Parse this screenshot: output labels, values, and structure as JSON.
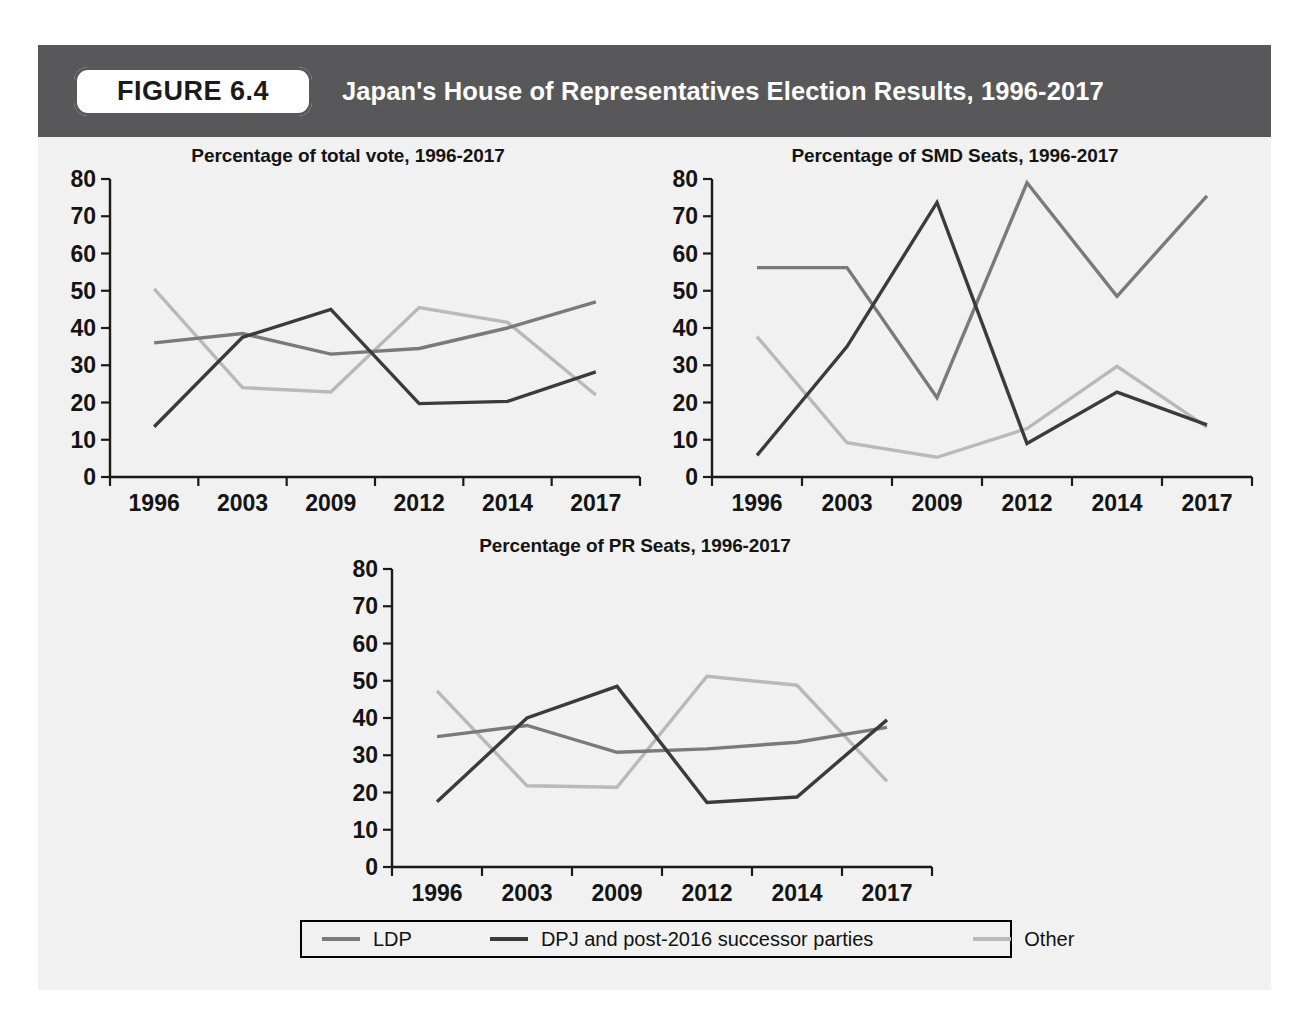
{
  "figure": {
    "badge_label": "FIGURE 6.4",
    "title": "Japan's House of Representatives Election Results, 1996-2017"
  },
  "colors": {
    "header_bar": "#58585a",
    "panel_background": "#f1f1f1",
    "page_background": "#ffffff",
    "axis": "#1a1a1a",
    "ldp": "#7a7a7a",
    "dpj": "#3b3b3b",
    "other": "#b9b9b9"
  },
  "legend": {
    "entries": [
      {
        "key": "ldp",
        "label": "LDP",
        "color": "#7a7a7a"
      },
      {
        "key": "dpj",
        "label": "DPJ and post-2016 successor parties",
        "color": "#3b3b3b"
      },
      {
        "key": "other",
        "label": "Other",
        "color": "#b9b9b9"
      }
    ]
  },
  "chart_data": [
    {
      "id": "total-vote",
      "type": "line",
      "title": "Percentage of total vote, 1996-2017",
      "xlabel": "",
      "ylabel": "",
      "categories": [
        "1996",
        "2003",
        "2009",
        "2012",
        "2014",
        "2017"
      ],
      "yticks": [
        0,
        10,
        20,
        30,
        40,
        50,
        60,
        70,
        80
      ],
      "ylim": [
        0,
        80
      ],
      "grid": false,
      "legend_position": "bottom-shared",
      "series": [
        {
          "name": "LDP",
          "color": "#7a7a7a",
          "values": [
            36.0,
            38.5,
            33.0,
            34.5,
            40.0,
            47.0
          ]
        },
        {
          "name": "DPJ and post-2016 successor parties",
          "color": "#3b3b3b",
          "values": [
            13.5,
            37.5,
            45.0,
            19.7,
            20.3,
            28.2
          ]
        },
        {
          "name": "Other",
          "color": "#b9b9b9",
          "values": [
            50.5,
            24.0,
            22.8,
            45.5,
            41.5,
            22.0
          ]
        }
      ]
    },
    {
      "id": "smd-seats",
      "type": "line",
      "title": "Percentage of SMD Seats, 1996-2017",
      "xlabel": "",
      "ylabel": "",
      "categories": [
        "1996",
        "2003",
        "2009",
        "2012",
        "2014",
        "2017"
      ],
      "yticks": [
        0,
        10,
        20,
        30,
        40,
        50,
        60,
        70,
        80
      ],
      "ylim": [
        0,
        80
      ],
      "grid": false,
      "legend_position": "bottom-shared",
      "series": [
        {
          "name": "LDP",
          "color": "#7a7a7a",
          "values": [
            56.2,
            56.2,
            21.3,
            79.0,
            48.5,
            75.5
          ]
        },
        {
          "name": "DPJ and post-2016 successor parties",
          "color": "#3b3b3b",
          "values": [
            5.8,
            35.0,
            73.7,
            9.0,
            22.8,
            14.0
          ]
        },
        {
          "name": "Other",
          "color": "#b9b9b9",
          "values": [
            37.7,
            9.2,
            5.3,
            13.0,
            29.7,
            13.4
          ]
        }
      ]
    },
    {
      "id": "pr-seats",
      "type": "line",
      "title": "Percentage of PR Seats, 1996-2017",
      "xlabel": "",
      "ylabel": "",
      "categories": [
        "1996",
        "2003",
        "2009",
        "2012",
        "2014",
        "2017"
      ],
      "yticks": [
        0,
        10,
        20,
        30,
        40,
        50,
        60,
        70,
        80
      ],
      "ylim": [
        0,
        80
      ],
      "grid": false,
      "legend_position": "bottom-shared",
      "series": [
        {
          "name": "LDP",
          "color": "#7a7a7a",
          "values": [
            35.0,
            38.0,
            30.8,
            31.7,
            33.5,
            37.5
          ]
        },
        {
          "name": "DPJ and post-2016 successor parties",
          "color": "#3b3b3b",
          "values": [
            17.5,
            40.0,
            48.5,
            17.3,
            18.8,
            39.5
          ]
        },
        {
          "name": "Other",
          "color": "#b9b9b9",
          "values": [
            47.3,
            21.8,
            21.4,
            51.2,
            48.8,
            23.0
          ]
        }
      ]
    }
  ]
}
